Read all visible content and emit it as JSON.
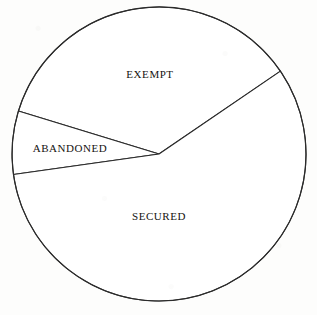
{
  "chart_data": {
    "type": "pie",
    "title": "",
    "subtitle": "",
    "xlabel": "",
    "ylabel": "",
    "legend_position": "none",
    "grid": false,
    "labels_inside_slices": true,
    "categories": [
      "EXEMPT",
      "ABANDONED",
      "SECURED"
    ],
    "values": [
      35.8,
      6.9,
      57.3
    ],
    "units": "percent",
    "slices": [
      {
        "label": "EXEMPT",
        "value": 35.8,
        "angle_degrees": 128.7,
        "start_angle_degrees": 34.3,
        "end_angle_degrees": 163.0,
        "color": "#ffffff",
        "edge_color": "#2b2b2b"
      },
      {
        "label": "ABANDONED",
        "value": 6.9,
        "angle_degrees": 25.0,
        "start_angle_degrees": 163.0,
        "end_angle_degrees": 188.0,
        "color": "#ffffff",
        "edge_color": "#2b2b2b"
      },
      {
        "label": "SECURED",
        "value": 57.3,
        "angle_degrees": 206.3,
        "start_angle_degrees": 188.0,
        "end_angle_degrees": 394.3,
        "color": "#ffffff",
        "edge_color": "#2b2b2b"
      }
    ],
    "geometry": {
      "center_x": 159,
      "center_y": 154,
      "radius": 147
    },
    "label_positions": [
      {
        "label": "EXEMPT",
        "x": 150,
        "y": 74
      },
      {
        "label": "ABANDONED",
        "x": 70,
        "y": 148
      },
      {
        "label": "SECURED",
        "x": 159,
        "y": 216
      }
    ]
  },
  "figure": {
    "background_color": "#fdfdfc",
    "line_color": "#2b2b2b",
    "text_color": "#15130f"
  }
}
